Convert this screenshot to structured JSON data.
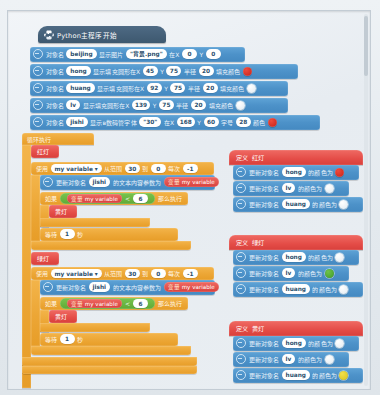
{
  "window": {
    "title": "Python主程序开始",
    "icon": "python-logo-icon"
  },
  "colors": {
    "hat": "#3d586f",
    "command_block": "#4d92c9",
    "control_block": "#eca635",
    "function_block": "#e44c47",
    "boolean_block": "#5faa36",
    "red_light": "#d9291c",
    "green_light": "#4fae2c",
    "yellow_light": "#e8d31f",
    "off_light": "#ffffff"
  },
  "setup_rows": [
    {
      "name": "show-image-row",
      "prefix": "对象名",
      "object": "beijing",
      "mid": "显示图片",
      "image": "\"背景.png\"",
      "x_label": "在X",
      "x": "0",
      "y_label": "Y",
      "y": "0"
    },
    {
      "name": "draw-circle-hong-row",
      "prefix": "对象名",
      "object": "hong",
      "mid": "显示填充圆形在X",
      "x": "45",
      "y_label": "Y",
      "y": "75",
      "radius_label": "半径",
      "radius": "20",
      "fill_label": "填充颜色",
      "fill_color": "red"
    },
    {
      "name": "draw-circle-huang-row",
      "prefix": "对象名",
      "object": "huang",
      "mid": "显示填充圆形在X",
      "x": "92",
      "y_label": "Y",
      "y": "75",
      "radius_label": "半径",
      "radius": "20",
      "fill_label": "填充颜色",
      "fill_color": "white"
    },
    {
      "name": "draw-circle-lv-row",
      "prefix": "对象名",
      "object": "lv",
      "mid": "显示填充圆形在X",
      "x": "139",
      "y_label": "Y",
      "y": "75",
      "radius_label": "半径",
      "radius": "20",
      "fill_label": "填充颜色",
      "fill_color": "white"
    },
    {
      "name": "show-digit-text-row",
      "prefix": "对象名",
      "object": "jishi",
      "mid": "显示в数码管字体",
      "text": "\"30\"",
      "x_label": "在X",
      "x": "168",
      "y_label": "Y",
      "y": "60",
      "size_label": "字号",
      "size": "28",
      "color_label": "颜色",
      "color": "red"
    }
  ],
  "loop": {
    "header": "循环执行",
    "call_red": "红灯",
    "call_yellow": "黄灯",
    "call_green": "绿灯",
    "for": {
      "use_label": "使用",
      "variable": "my variable ▾",
      "from_label": "从范围",
      "from": "30",
      "to_label": "到",
      "to": "0",
      "step_label": "每次",
      "step": "-1"
    },
    "update_text": {
      "prefix": "更新对象名",
      "object": "jishi",
      "mid": "的文本内容参数为",
      "value_kind": "变量",
      "value": "my variable"
    },
    "if_block": {
      "if_label": "如果",
      "var_kind": "变量",
      "var": "my variable",
      "op": "<",
      "operand": "6",
      "then_label": "那么执行"
    },
    "wait": {
      "label": "等待",
      "seconds": "1",
      "unit": "秒"
    }
  },
  "definitions": [
    {
      "name": "define-red-light",
      "def_label": "定义",
      "title": "红灯",
      "rows": [
        {
          "prefix": "更新对象名",
          "object": "hong",
          "mid": "的颜色为",
          "color": "red"
        },
        {
          "prefix": "更新对象名",
          "object": "lv",
          "mid": "的颜色为",
          "color": "white"
        },
        {
          "prefix": "更新对象名",
          "object": "huang",
          "mid": "的颜色为",
          "color": "white"
        }
      ]
    },
    {
      "name": "define-green-light",
      "def_label": "定义",
      "title": "绿灯",
      "rows": [
        {
          "prefix": "更新对象名",
          "object": "hong",
          "mid": "的颜色为",
          "color": "white"
        },
        {
          "prefix": "更新对象名",
          "object": "lv",
          "mid": "的颜色为",
          "color": "green"
        },
        {
          "prefix": "更新对象名",
          "object": "huang",
          "mid": "的颜色为",
          "color": "white"
        }
      ]
    },
    {
      "name": "define-yellow-light",
      "def_label": "定义",
      "title": "黄灯",
      "rows": [
        {
          "prefix": "更新对象名",
          "object": "hong",
          "mid": "的颜色为",
          "color": "white"
        },
        {
          "prefix": "更新对象名",
          "object": "lv",
          "mid": "的颜色为",
          "color": "white"
        },
        {
          "prefix": "更新对象名",
          "object": "huang",
          "mid": "的颜色为",
          "color": "yellow"
        }
      ]
    }
  ]
}
